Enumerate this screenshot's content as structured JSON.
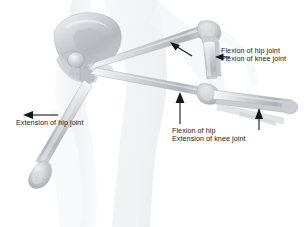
{
  "figure": {
    "background_color": "#ffffff",
    "bone_color": "#b9bcc0",
    "bone_light_color": "#e3e5e8",
    "body_outline_color": "#eceef0",
    "annotation_color": "#16181a",
    "width": 307,
    "height": 227
  },
  "annotations": [
    {
      "id": "flexion-hip-knee",
      "line1": "Flexion of hip joint",
      "line2": "Flexion of knee joint",
      "arrow": "left-pointing-arrow"
    },
    {
      "id": "extension-hip",
      "line1": "Extension of hip joint",
      "line2": "",
      "arrow": "left-pointing-arrow"
    },
    {
      "id": "flexion-hip-extension-knee",
      "line1": "Flexion of hip",
      "line2": "Extension of knee joint",
      "arrow": "up-pointing-arrow"
    }
  ],
  "arrows": [
    {
      "id": "arrow-knee-flexion-diagonal",
      "direction": "up-left",
      "points_at": "flexed-knee-joint"
    },
    {
      "id": "arrow-flexion-horizontal",
      "direction": "left",
      "points_at": "flexed-tibia"
    },
    {
      "id": "arrow-extension-hip",
      "direction": "left",
      "points_at": "extended-femur-shaft"
    },
    {
      "id": "arrow-flexion-hip-vertical",
      "direction": "up",
      "points_at": "horizontal-femur-shaft"
    },
    {
      "id": "arrow-extended-knee",
      "direction": "up",
      "points_at": "extended-tibia"
    }
  ],
  "anatomy": [
    {
      "id": "pelvis",
      "label": "Pelvis (ilium and acetabulum)"
    },
    {
      "id": "femur-flexed",
      "label": "Femur in hip flexion"
    },
    {
      "id": "femur-horizontal",
      "label": "Femur in intermediate position"
    },
    {
      "id": "femur-extended",
      "label": "Femur in hip extension"
    },
    {
      "id": "tibia-flexed-knee",
      "label": "Tibia and fibula with knee flexed"
    },
    {
      "id": "tibia-extended-knee",
      "label": "Tibia and fibula with knee extended"
    },
    {
      "id": "body-silhouette",
      "label": "Body silhouette of torso and legs"
    }
  ]
}
